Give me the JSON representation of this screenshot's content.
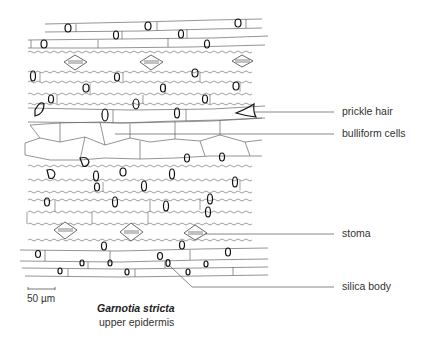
{
  "figure": {
    "species": "Garnotia stricta",
    "subtitle": "upper epidermis",
    "scale_bar": {
      "label": "50 µm"
    }
  },
  "labels": [
    {
      "id": "prickle-hair",
      "text": "prickle hair",
      "line_y": 112
    },
    {
      "id": "bulliform-cells",
      "text": "bulliform cells",
      "line_y": 134
    },
    {
      "id": "stoma",
      "text": "stoma",
      "line_y": 234
    },
    {
      "id": "silica-body",
      "text": "silica body",
      "line_y": 287
    }
  ],
  "colors": {
    "line": "#555555",
    "ink": "#111111",
    "text": "#333333"
  }
}
